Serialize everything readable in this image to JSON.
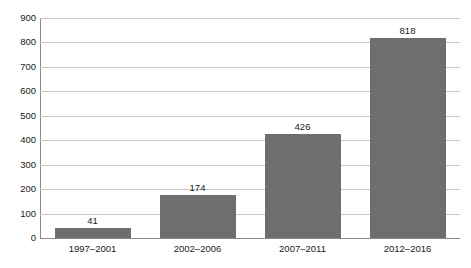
{
  "chart_data": {
    "type": "bar",
    "title": "",
    "subtitle": "",
    "xlabel": "",
    "ylabel": "",
    "categories": [
      "1997–2001",
      "2002–2006",
      "2007–2011",
      "2012–2016"
    ],
    "values": [
      41,
      174,
      426,
      818
    ],
    "data_labels": [
      "41",
      "174",
      "426",
      "818"
    ],
    "ylim": [
      0,
      900
    ],
    "ytick_step": 100,
    "ytick_labels": [
      "0",
      "100",
      "200",
      "300",
      "400",
      "500",
      "600",
      "700",
      "800",
      "900"
    ],
    "grid": {
      "horizontal": true,
      "vertical": false
    },
    "legend": {
      "visible": false,
      "position": "none",
      "entries": []
    },
    "series": [
      {
        "name": "",
        "values": [
          41,
          174,
          426,
          818
        ]
      }
    ],
    "colors": {
      "bar_fill": "#6e6e6e",
      "gridline": "#c8c8c8",
      "axis_line": "#8a8a8a",
      "text": "#1a1a1a",
      "background": "#ffffff"
    }
  }
}
